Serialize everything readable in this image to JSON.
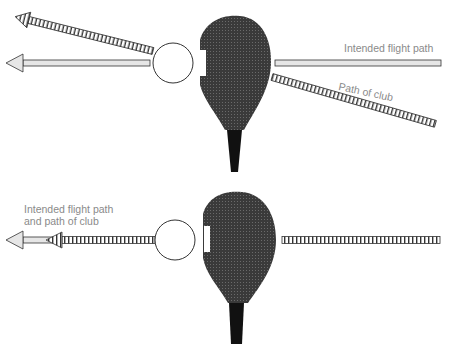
{
  "top_diagram": {
    "label_intended": "Intended flight path",
    "label_club": "Path of club"
  },
  "bottom_diagram": {
    "label_line1": "Intended flight path",
    "label_line2": "and path of club"
  },
  "colors": {
    "clubhead": "#2e2e2e",
    "shaft": "#111111",
    "arrow_fill": "#e6e6e6",
    "stroke": "#333333",
    "label": "#8a8a8a"
  }
}
